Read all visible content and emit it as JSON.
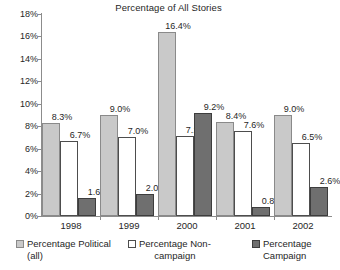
{
  "chart_data": {
    "type": "bar",
    "title": "Percentage of All Stories",
    "xlabel": "",
    "ylabel": "",
    "ylim": [
      0,
      18
    ],
    "ytick_labels": [
      "0%",
      "2%",
      "4%",
      "6%",
      "8%",
      "10%",
      "12%",
      "14%",
      "16%",
      "18%"
    ],
    "ytick_values": [
      0,
      2,
      4,
      6,
      8,
      10,
      12,
      14,
      16,
      18
    ],
    "grid": false,
    "legend_position": "bottom",
    "categories": [
      "1998",
      "1999",
      "2000",
      "2001",
      "2002"
    ],
    "series": [
      {
        "name": "Percentage Political (all)",
        "color": "#c9c9c9",
        "values": [
          8.3,
          9.0,
          16.4,
          8.4,
          9.0
        ],
        "labels": [
          "8.3%",
          "9.0%",
          "16.4%",
          "8.4%",
          "9.0%"
        ]
      },
      {
        "name": "Percentage Non-campaign",
        "color": "#ffffff",
        "values": [
          6.7,
          7.0,
          7.1,
          7.6,
          6.5
        ],
        "labels": [
          "6.7%",
          "7.0%",
          "7.1%",
          "7.6%",
          "6.5%"
        ]
      },
      {
        "name": "Percentage Campaign",
        "color": "#6f6f6f",
        "values": [
          1.6,
          2.0,
          9.2,
          0.8,
          2.6
        ],
        "labels": [
          "1.6%",
          "2.0%",
          "9.2%",
          "0.8%",
          "2.6%"
        ]
      }
    ]
  },
  "legend": [
    {
      "line1": "Percentage Political",
      "line2": "(all)"
    },
    {
      "line1": "Percentage Non-",
      "line2": "campaign"
    },
    {
      "line1": "Percentage",
      "line2": "Campaign"
    }
  ]
}
